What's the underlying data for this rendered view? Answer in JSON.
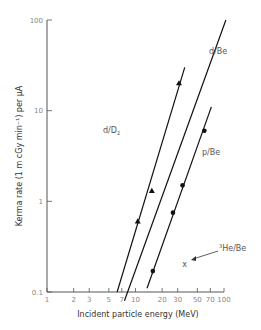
{
  "chart_data": {
    "type": "line",
    "title": "",
    "xlabel": "Incident particle energy (MeV)",
    "ylabel": "Kerma rate (1 m cGy min⁻¹) per μA",
    "xscale": "log",
    "yscale": "log",
    "xlim": [
      1,
      100
    ],
    "ylim": [
      0.1,
      100
    ],
    "grid": false,
    "legend": "inline labels",
    "x_ticks": [
      1,
      2,
      3,
      5,
      7,
      10,
      20,
      30,
      50,
      70,
      100
    ],
    "x_tick_labels": [
      "1",
      "2",
      "3",
      "5",
      "7",
      "10",
      "20",
      "30",
      "50",
      "70",
      "100"
    ],
    "y_ticks": [
      0.1,
      1,
      10,
      100
    ],
    "y_tick_labels": [
      "0.1",
      "1",
      "10",
      "100"
    ],
    "series": [
      {
        "name": "d/D2",
        "label": "d/D",
        "label_sub": "2",
        "marker": "triangle",
        "points": [
          [
            10.6,
            0.6
          ],
          [
            15.3,
            1.3
          ],
          [
            31,
            20
          ]
        ],
        "fit_line": [
          [
            6.2,
            0.1
          ],
          [
            36,
            30
          ]
        ]
      },
      {
        "name": "d/Be",
        "label": "d/Be",
        "marker": "none",
        "points": [],
        "fit_line": [
          [
            7.5,
            0.08
          ],
          [
            105,
            100
          ]
        ]
      },
      {
        "name": "p/Be",
        "label": "p/Be",
        "marker": "circle",
        "points": [
          [
            15.7,
            0.17
          ],
          [
            26.5,
            0.75
          ],
          [
            34,
            1.5
          ],
          [
            60,
            6
          ]
        ],
        "fit_line": [
          [
            13.5,
            0.11
          ],
          [
            72,
            11
          ]
        ]
      },
      {
        "name": "3He/Be",
        "label": "He/Be",
        "label_sup": "3",
        "marker": "x",
        "points": [
          [
            36,
            0.2
          ]
        ]
      }
    ]
  }
}
